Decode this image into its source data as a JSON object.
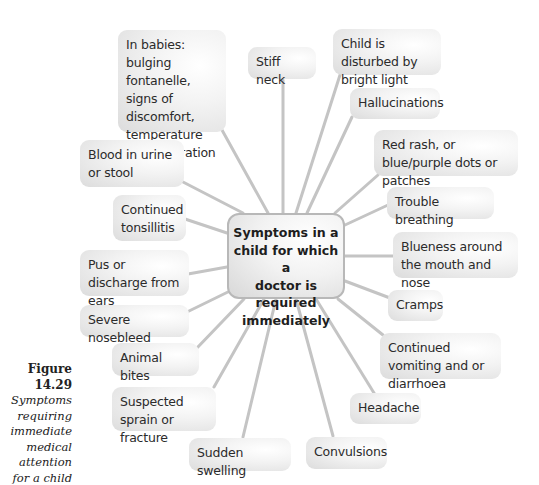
{
  "diagram": {
    "center": {
      "label": "Symptoms in a child for which a doctor is required immediately",
      "lines": [
        "Symptoms in a",
        "child for which a",
        "doctor is required",
        "immediately"
      ]
    },
    "nodes": [
      {
        "id": "babies",
        "label": "In babies: bulging fontanelle, signs of discomfort, temperature or dehydration"
      },
      {
        "id": "stiff-neck",
        "label": "Stiff neck"
      },
      {
        "id": "bright-light",
        "label": "Child is disturbed by bright light"
      },
      {
        "id": "hallucinations",
        "label": "Hallucinations"
      },
      {
        "id": "red-rash",
        "label": "Red rash, or blue/purple dots or patches"
      },
      {
        "id": "trouble-breathing",
        "label": "Trouble breathing"
      },
      {
        "id": "blueness",
        "label": "Blueness around the mouth and nose"
      },
      {
        "id": "cramps",
        "label": "Cramps"
      },
      {
        "id": "vomiting",
        "label": "Continued vomiting and or diarrhoea"
      },
      {
        "id": "headache",
        "label": "Headache"
      },
      {
        "id": "convulsions",
        "label": "Convulsions"
      },
      {
        "id": "sudden-swelling",
        "label": "Sudden swelling"
      },
      {
        "id": "sprain",
        "label": "Suspected sprain or fracture"
      },
      {
        "id": "animal-bites",
        "label": "Animal bites"
      },
      {
        "id": "nosebleed",
        "label": "Severe nosebleed"
      },
      {
        "id": "ears",
        "label": "Pus or discharge from ears"
      },
      {
        "id": "tonsillitis",
        "label": "Continued tonsillitis"
      },
      {
        "id": "blood",
        "label": "Blood in urine or stool"
      }
    ],
    "colors": {
      "link": "#c4c4c4",
      "node_fill": "#e6e6e6",
      "center_border": "#b8b8b8",
      "text": "#2b2b2b"
    }
  },
  "caption": {
    "figure": "Figure 14.29",
    "description": "Symptoms requiring immediate medical attention for a child"
  }
}
